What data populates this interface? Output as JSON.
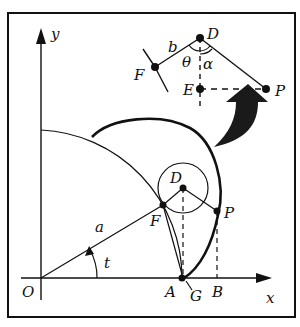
{
  "diagram": {
    "axes": {
      "x_label": "x",
      "y_label": "y",
      "origin_label": "O"
    },
    "main_points": {
      "O": "O",
      "A": "A",
      "G": "G",
      "B": "B",
      "D": "D",
      "F": "F",
      "P": "P"
    },
    "main_labels": {
      "radius": "a",
      "angle": "t"
    },
    "inset": {
      "points": {
        "D": "D",
        "F": "F",
        "E": "E",
        "P": "P"
      },
      "labels": {
        "length": "b",
        "theta": "θ",
        "alpha": "α"
      }
    },
    "colors": {
      "stroke": "#111111",
      "background": "#ffffff",
      "arrow": "#1a1a1a"
    }
  }
}
